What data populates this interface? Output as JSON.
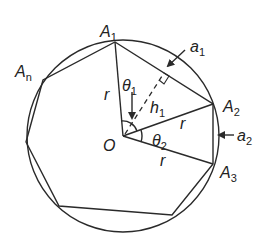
{
  "diagram": {
    "circle": {
      "cx": 123,
      "cy": 136,
      "r": 96
    },
    "center": {
      "label": "O",
      "x": 123,
      "y": 136
    },
    "vertices": [
      {
        "id": "A1",
        "label": "A",
        "sub": "1",
        "x": 115,
        "y": 42
      },
      {
        "id": "A2",
        "label": "A",
        "sub": "2",
        "x": 213,
        "y": 104
      },
      {
        "id": "A3",
        "label": "A",
        "sub": "3",
        "x": 213,
        "y": 164
      },
      {
        "id": "V4",
        "label": "",
        "sub": "",
        "x": 172,
        "y": 215
      },
      {
        "id": "V5",
        "label": "",
        "sub": "",
        "x": 59,
        "y": 206
      },
      {
        "id": "V6",
        "label": "",
        "sub": "",
        "x": 26,
        "y": 142
      },
      {
        "id": "An",
        "label": "A",
        "sub": "n",
        "x": 43,
        "y": 80
      }
    ],
    "labels": {
      "A1": {
        "main": "A",
        "sub": "1"
      },
      "A2": {
        "main": "A",
        "sub": "2"
      },
      "A3": {
        "main": "A",
        "sub": "3"
      },
      "An": {
        "main": "A",
        "sub": "n"
      },
      "O": "O",
      "r": "r",
      "theta1": {
        "main": "θ",
        "sub": "1"
      },
      "theta2": {
        "main": "θ",
        "sub": "2"
      },
      "h1": {
        "main": "h",
        "sub": "1"
      },
      "a1": {
        "main": "a",
        "sub": "1"
      },
      "a2": {
        "main": "a",
        "sub": "2"
      }
    }
  }
}
